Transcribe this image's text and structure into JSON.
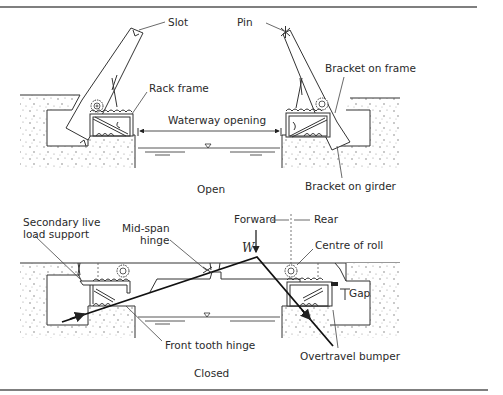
{
  "figure": {
    "panels": [
      {
        "id": "open",
        "caption": "Open",
        "labels": {
          "slot": "Slot",
          "pin": "Pin",
          "rack_frame": "Rack frame",
          "waterway_opening": "Waterway opening",
          "bracket_on_frame": "Bracket on frame",
          "bracket_on_girder": "Bracket on girder"
        }
      },
      {
        "id": "closed",
        "caption": "Closed",
        "labels": {
          "secondary_live_load_support_1": "Secondary live",
          "secondary_live_load_support_2": "load support",
          "mid_span_hinge_1": "Mid-span",
          "mid_span_hinge_2": "hinge",
          "forward": "Forward",
          "rear": "Rear",
          "load": "W",
          "centre_of_roll": "Centre of roll",
          "gap": "Gap",
          "front_tooth_hinge": "Front tooth hinge",
          "overtravel_bumper": "Overtravel bumper"
        }
      }
    ],
    "colors": {
      "line": "#333333",
      "text": "#2a2a2a",
      "rule": "#555555",
      "background": "#ffffff"
    }
  }
}
